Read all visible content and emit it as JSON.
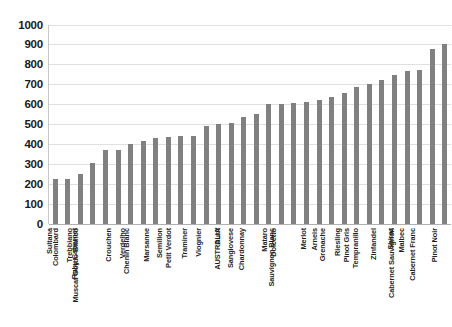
{
  "chart_data": {
    "type": "bar",
    "title": "",
    "subtitle": "",
    "xlabel": "",
    "ylabel": "",
    "ylim": [
      0,
      1000
    ],
    "grid": true,
    "legend": false,
    "bar_color": "#808080",
    "gridline_color": "#e0e0e0",
    "axis_color": "#c8c8c8",
    "yticks": [
      0,
      100,
      200,
      300,
      400,
      500,
      600,
      700,
      800,
      900,
      1000
    ],
    "ytick_labels": [
      "0",
      "100",
      "200",
      "300",
      "400",
      "500",
      "600",
      "700",
      "800",
      "900",
      "1000"
    ],
    "categories": [
      "Sultana",
      "Colombard",
      "Trebbiano",
      "Ruby Cabernet",
      "Muscat Gordo Blanco",
      "Crouchen",
      "Verdelho",
      "Chenin Blanc",
      "Marsanne",
      "Semillon",
      "Petit Verdot",
      "Traminer",
      "Viognier",
      "Durif",
      "AUSTRALIA",
      "Sangiovese",
      "Chardonnay",
      "Mataro",
      "Dolcetto",
      "Sauvignon Blanc",
      "Merlot",
      "Arneis",
      "Grenache",
      "Riesling",
      "Pinot Gris",
      "Tempranillo",
      "Zinfandel",
      "Shiraz",
      "Malbec",
      "Cabernet Sauvignon",
      "Cabernet Franc",
      "Pinot Noir"
    ],
    "values": [
      228,
      228,
      252,
      308,
      372,
      372,
      400,
      418,
      430,
      438,
      440,
      442,
      490,
      500,
      505,
      535,
      550,
      600,
      600,
      605,
      610,
      620,
      635,
      655,
      685,
      700,
      720,
      745,
      765,
      770,
      875,
      900
    ]
  }
}
